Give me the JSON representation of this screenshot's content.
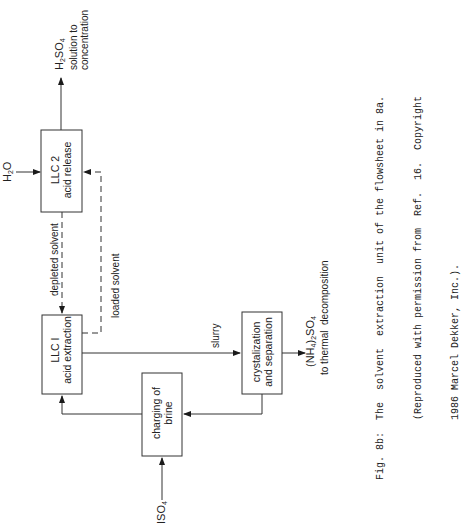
{
  "figure": {
    "type": "flowsheet",
    "orientation": "rotated-90-ccw",
    "nodes": [
      {
        "id": "llc2",
        "line1": "LLC 2",
        "line2": "acid release"
      },
      {
        "id": "llc1",
        "line1": "LLC I",
        "line2": "acid extraction"
      },
      {
        "id": "charging",
        "line1": "charging of",
        "line2": "brine"
      },
      {
        "id": "cryst",
        "line1": "crystalization",
        "line2": "and separation"
      }
    ],
    "streams": {
      "h2o": {
        "label": "H",
        "sub": "2",
        "rest": "O"
      },
      "h2so4": {
        "label": "H",
        "sub": "2",
        "rest": "SO",
        "sub2": "4",
        "line2": "solution to",
        "line3": "concentration"
      },
      "depleted": "depleted solvent",
      "loaded": "loaded solvent",
      "slurry": "slurry",
      "nh4so4": {
        "pre": "(NH",
        "sub": "4",
        "mid": ")",
        "sub2": "2",
        "rest": "SO",
        "sub3": "4",
        "line2": "to thermal  decomposition"
      },
      "input": {
        "label": "ISO",
        "sub": "4"
      }
    },
    "edges": [
      {
        "from": "H2O",
        "to": "llc2"
      },
      {
        "from": "llc2",
        "to": "H2SO4 solution to concentration"
      },
      {
        "from": "llc2",
        "to": "llc1",
        "label": "depleted solvent",
        "style": "dashed"
      },
      {
        "from": "llc1",
        "to": "llc2",
        "label": "loaded solvent",
        "style": "dashed"
      },
      {
        "from": "llc1",
        "to": "cryst",
        "label": "slurry"
      },
      {
        "from": "cryst",
        "to": "(NH4)2SO4 to thermal decomposition"
      },
      {
        "from": "cryst",
        "to": "charging"
      },
      {
        "from": "charging",
        "to": "llc1"
      },
      {
        "from": "ISO4",
        "to": "charging"
      }
    ]
  },
  "caption": {
    "line1": "Fig. 8b:  The  solvent  extraction  unit of the flowsheet in 8a.",
    "line2": "          (Reproduced with permission from  Ref.  16.  Copyright",
    "line3": "          1986 Marcel Dekker, Inc.)."
  }
}
